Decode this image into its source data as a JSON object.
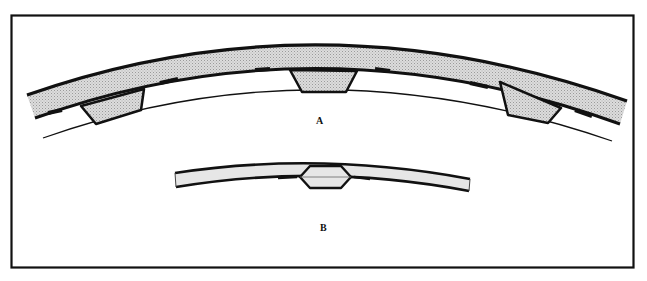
{
  "figure": {
    "type": "technical line drawing",
    "panels": [
      {
        "id": "A",
        "label": "A",
        "description": "Curved banded arc with three trapezoidal inserts along inner edge, thin concentric ring line beneath"
      },
      {
        "id": "B",
        "label": "B",
        "description": "Thin curved strip with central hexagonal joint"
      }
    ],
    "colors": {
      "stroke": "#111111",
      "band_fill": "#d6d6d6",
      "strip_fill": "#e6e6e6",
      "background": "#ffffff"
    }
  }
}
